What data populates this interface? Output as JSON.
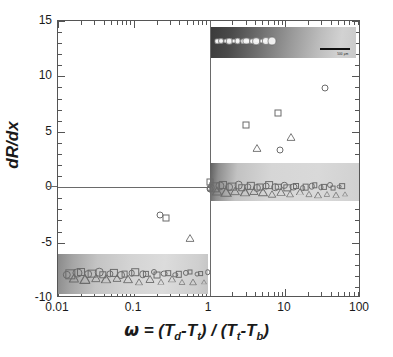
{
  "figure": {
    "background_color": "#ffffff",
    "frame_color": "#555555",
    "marker_color": "#6b6b6b"
  },
  "axes": {
    "y_title": "dR/dx",
    "x_title_parts": {
      "omega": "ω",
      "equals": " = (",
      "T1": "T",
      "sub1": "d",
      "minus1": "-",
      "T2": "T",
      "sub2": "t",
      "close1": ") / (",
      "T3": "T",
      "sub3": "t",
      "minus2": "-",
      "T4": "T",
      "sub4": "b",
      "close2": ")"
    },
    "x_tick_labels": [
      "0.01",
      "0.1",
      "1",
      "10",
      "100"
    ],
    "y_tick_labels": [
      "15",
      "10",
      "5",
      "0",
      "-5",
      "-10"
    ]
  },
  "insets": {
    "top_right": {
      "name": "microscopy-inset-top-right",
      "scalebar_label": "500 µm"
    },
    "middle_right": {
      "name": "microscopy-inset-middle-right"
    },
    "bottom_left": {
      "name": "microscopy-inset-bottom-left"
    }
  },
  "chart_data": {
    "type": "scatter",
    "title": "",
    "xlabel": "ω = (Td-Tt) / (Tt-Tb)",
    "ylabel": "dR/dx",
    "xscale": "log",
    "yscale": "linear",
    "xlim": [
      0.01,
      100
    ],
    "ylim": [
      -10,
      15
    ],
    "xticks": [
      0.01,
      0.1,
      1,
      10,
      100
    ],
    "yticks": [
      -10,
      -5,
      0,
      5,
      10,
      15
    ],
    "grid": false,
    "legend": false,
    "reference_lines": [
      {
        "type": "horizontal",
        "y": 0
      },
      {
        "type": "vertical",
        "x": 1
      }
    ],
    "series": [
      {
        "name": "circles",
        "marker": "circle",
        "points": [
          {
            "x": 0.22,
            "y": -2.5
          },
          {
            "x": 1.02,
            "y": -0.15
          },
          {
            "x": 8.5,
            "y": 3.35
          },
          {
            "x": 33.0,
            "y": 8.95
          }
        ]
      },
      {
        "name": "squares",
        "marker": "square",
        "points": [
          {
            "x": 0.27,
            "y": -2.75
          },
          {
            "x": 1.02,
            "y": 0.45
          },
          {
            "x": 3.0,
            "y": 5.6
          },
          {
            "x": 8.1,
            "y": 6.7
          }
        ]
      },
      {
        "name": "triangles",
        "marker": "triangle",
        "points": [
          {
            "x": 0.55,
            "y": -4.05
          },
          {
            "x": 4.2,
            "y": 4.1
          },
          {
            "x": 12.0,
            "y": 5.05
          }
        ]
      }
    ],
    "marker_bands": [
      {
        "name": "lower-left-band",
        "y": -7.8,
        "x_start": 0.013,
        "x_end": 0.95,
        "count": 40,
        "description": "dense row of overlapping open markers along y = -7.8"
      },
      {
        "name": "right-band",
        "y": 0.05,
        "x_start": 1.05,
        "x_end": 62.0,
        "count": 45,
        "description": "dense row of overlapping open markers along y = 0"
      }
    ]
  }
}
